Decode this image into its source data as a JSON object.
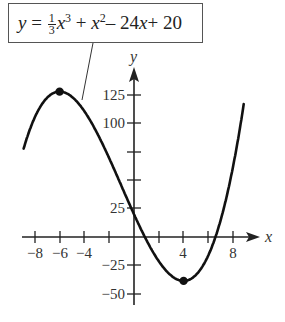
{
  "equation": {
    "lhs": "y",
    "equals": "=",
    "coef_num": "1",
    "coef_den": "3",
    "term1_var": "x",
    "term1_exp": "3",
    "plus1": "+",
    "term2_var": "x",
    "term2_exp": "2",
    "minus": "–",
    "term3_coef": "24",
    "term3_var": "x",
    "plus2": "+",
    "constant": "20",
    "full_text": "y = (1/3)x^3 + x^2 – 24x + 20"
  },
  "axes": {
    "x_label": "x",
    "y_label": "y",
    "x_ticks": [
      -8,
      -6,
      -4,
      -2,
      0,
      2,
      4,
      6,
      8
    ],
    "x_tick_labels": [
      "−8",
      "−6",
      "−4",
      "4",
      "8"
    ],
    "y_ticks": [
      -50,
      -25,
      0,
      25,
      50,
      75,
      100,
      125
    ],
    "y_tick_labels": [
      "125",
      "100",
      "25",
      "−25",
      "−50"
    ]
  },
  "points": {
    "local_max": {
      "x": -6,
      "y": 128
    },
    "local_min": {
      "x": 4,
      "y": -38.67
    }
  },
  "colors": {
    "curve": "#111111",
    "axes": "#222222",
    "box_border": "#555555",
    "text": "#333333"
  },
  "chart_data": {
    "type": "line",
    "xlabel": "x",
    "ylabel": "y",
    "xlim": [
      -9,
      9
    ],
    "ylim": [
      -55,
      140
    ],
    "function": "x^3/3 + x^2 - 24x + 20",
    "series": [
      {
        "name": "y = (1/3)x^3 + x^2 - 24x + 20",
        "x": [
          -9,
          -8,
          -7,
          -6,
          -5,
          -4,
          -3,
          -2,
          -1,
          0,
          1,
          2,
          3,
          4,
          5,
          6,
          7,
          8,
          9
        ],
        "values": [
          74,
          104.3,
          121.7,
          128,
          125.3,
          115.7,
          101,
          83.3,
          64.7,
          20,
          -2.67,
          -17.3,
          -28,
          -38.67,
          -31.3,
          -16,
          2.67,
          41.3,
          128
        ]
      }
    ],
    "marked_points": [
      {
        "label": "local maximum",
        "x": -6,
        "y": 128
      },
      {
        "label": "local minimum",
        "x": 4,
        "y": -38.67
      }
    ],
    "x_tick_labels": [
      "-8",
      "-6",
      "-4",
      "4",
      "8"
    ],
    "y_tick_labels": [
      "125",
      "100",
      "25",
      "-25",
      "-50"
    ],
    "grid": false
  }
}
